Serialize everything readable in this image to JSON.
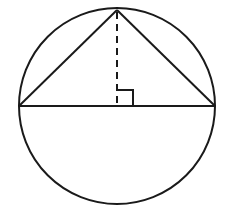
{
  "diagram": {
    "colors": {
      "stroke": "#1a1a1a",
      "background": "#ffffff"
    },
    "circle": {
      "cx": 117,
      "cy": 106,
      "r": 98
    },
    "diameter": {
      "x1": 19,
      "y1": 106,
      "x2": 215,
      "y2": 106
    },
    "triangle": {
      "apex": [
        117,
        10
      ],
      "left": [
        19,
        106
      ],
      "right": [
        215,
        106
      ]
    },
    "altitude": {
      "x1": 117,
      "y1": 10,
      "x2": 117,
      "y2": 106,
      "style": "dashed"
    },
    "right_angle_marker": {
      "x": 117,
      "y": 90,
      "size": 16
    }
  }
}
